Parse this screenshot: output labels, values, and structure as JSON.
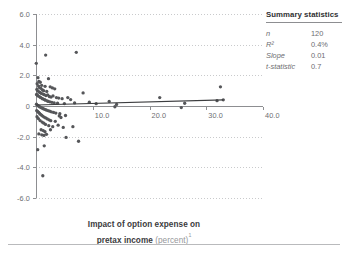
{
  "axis_title": {
    "line1": "Impact of option expense on",
    "line2_strong": "pretax income",
    "line2_light": "(percent)",
    "footnote_marker": "1"
  },
  "summary": {
    "title": "Summary statistics",
    "rows": [
      {
        "label": "n",
        "value": "120"
      },
      {
        "label": "R²",
        "value": "0.4%"
      },
      {
        "label": "Slope",
        "value": "0.01"
      },
      {
        "label": "t-statistic",
        "value": "0.7"
      }
    ]
  },
  "colors": {
    "point": "#555659",
    "trendline": "#3d3e40",
    "axis": "#8d8e91",
    "grid": "#c9cacc",
    "text": "#6d6e71",
    "title_text": "#3b3b3d",
    "light_text": "#96979a",
    "background": "#ffffff"
  },
  "chart_data": {
    "type": "scatter",
    "title": "",
    "xlabel": "Impact of option expense on pretax income (percent)",
    "ylabel": "",
    "xlim": [
      0,
      40
    ],
    "ylim": [
      -6,
      6
    ],
    "xticks": [
      0,
      10,
      20,
      30,
      40
    ],
    "xtick_labels": [
      "",
      "10.0",
      "20.0",
      "30.0",
      "40.0"
    ],
    "yticks": [
      6,
      4,
      2,
      0,
      -2,
      -4,
      -6
    ],
    "ytick_labels": [
      "6.0",
      "4.0",
      "2.0",
      "0",
      "-2.0",
      "-4.0",
      "-6.0"
    ],
    "grid": "horizontal-dotted",
    "legend": "none",
    "trendline": {
      "type": "linear",
      "slope": 0.01,
      "intercept": 0.07,
      "x_start": 0.0,
      "x_end": 33.0,
      "y_start": 0.07,
      "y_end": 0.4
    },
    "series": [
      {
        "name": "Companies",
        "marker": "circle",
        "color": "#555659",
        "points": [
          [
            0.05,
            2.78
          ],
          [
            1.7,
            3.32
          ],
          [
            7.1,
            3.5
          ],
          [
            0.35,
            1.85
          ],
          [
            0.5,
            1.6
          ],
          [
            0.75,
            1.55
          ],
          [
            1.0,
            1.35
          ],
          [
            2.2,
            1.78
          ],
          [
            2.5,
            1.25
          ],
          [
            2.9,
            1.18
          ],
          [
            3.3,
            1.12
          ],
          [
            0.2,
            1.45
          ],
          [
            0.45,
            1.3
          ],
          [
            0.6,
            1.2
          ],
          [
            0.85,
            1.15
          ],
          [
            1.15,
            1.05
          ],
          [
            1.35,
            1.0
          ],
          [
            1.6,
            1.28
          ],
          [
            1.9,
            0.95
          ],
          [
            0.15,
            1.08
          ],
          [
            0.3,
            0.98
          ],
          [
            0.55,
            0.92
          ],
          [
            0.7,
            0.88
          ],
          [
            0.95,
            0.82
          ],
          [
            1.25,
            0.78
          ],
          [
            1.45,
            0.74
          ],
          [
            1.75,
            0.68
          ],
          [
            2.05,
            0.72
          ],
          [
            2.35,
            0.62
          ],
          [
            2.65,
            0.58
          ],
          [
            3.0,
            0.66
          ],
          [
            3.6,
            0.55
          ],
          [
            4.0,
            0.52
          ],
          [
            4.6,
            0.48
          ],
          [
            0.1,
            0.75
          ],
          [
            0.25,
            0.7
          ],
          [
            0.4,
            0.65
          ],
          [
            0.65,
            0.6
          ],
          [
            0.8,
            0.56
          ],
          [
            1.05,
            0.5
          ],
          [
            1.2,
            0.46
          ],
          [
            1.5,
            0.42
          ],
          [
            1.65,
            0.38
          ],
          [
            1.95,
            0.34
          ],
          [
            2.15,
            0.3
          ],
          [
            2.45,
            0.27
          ],
          [
            2.8,
            0.24
          ],
          [
            3.2,
            0.2
          ],
          [
            3.8,
            0.18
          ],
          [
            5.0,
            0.16
          ],
          [
            5.6,
            0.55
          ],
          [
            6.1,
            0.42
          ],
          [
            6.8,
            0.2
          ],
          [
            8.3,
            0.85
          ],
          [
            9.4,
            0.25
          ],
          [
            10.6,
            0.15
          ],
          [
            12.9,
            0.3
          ],
          [
            13.9,
            -0.05
          ],
          [
            14.2,
            0.1
          ],
          [
            21.8,
            0.55
          ],
          [
            25.6,
            -0.1
          ],
          [
            26.2,
            0.18
          ],
          [
            31.9,
            0.35
          ],
          [
            32.5,
            1.25
          ],
          [
            33.0,
            0.4
          ],
          [
            0.08,
            0.12
          ],
          [
            0.22,
            0.06
          ],
          [
            0.38,
            0.02
          ],
          [
            0.52,
            -0.02
          ],
          [
            0.68,
            -0.06
          ],
          [
            0.88,
            -0.1
          ],
          [
            1.1,
            -0.14
          ],
          [
            1.3,
            -0.18
          ],
          [
            1.55,
            -0.22
          ],
          [
            1.8,
            -0.26
          ],
          [
            2.1,
            -0.3
          ],
          [
            2.4,
            -0.34
          ],
          [
            2.7,
            -0.38
          ],
          [
            3.1,
            -0.42
          ],
          [
            3.5,
            -0.46
          ],
          [
            4.2,
            -0.5
          ],
          [
            0.12,
            -0.3
          ],
          [
            0.28,
            -0.36
          ],
          [
            0.48,
            -0.42
          ],
          [
            0.62,
            -0.48
          ],
          [
            0.78,
            -0.54
          ],
          [
            0.98,
            -0.6
          ],
          [
            1.18,
            -0.66
          ],
          [
            1.42,
            -0.72
          ],
          [
            1.7,
            -0.78
          ],
          [
            2.0,
            -0.84
          ],
          [
            2.3,
            -0.9
          ],
          [
            2.6,
            -0.96
          ],
          [
            3.4,
            -1.0
          ],
          [
            4.4,
            -0.75
          ],
          [
            5.2,
            -0.62
          ],
          [
            0.18,
            -0.7
          ],
          [
            0.42,
            -0.82
          ],
          [
            0.72,
            -0.95
          ],
          [
            1.08,
            -1.05
          ],
          [
            1.38,
            -1.12
          ],
          [
            1.68,
            -1.2
          ],
          [
            2.25,
            -1.28
          ],
          [
            2.95,
            -1.35
          ],
          [
            3.9,
            -1.25
          ],
          [
            4.8,
            -1.4
          ],
          [
            6.5,
            -1.35
          ],
          [
            0.9,
            -1.55
          ],
          [
            1.28,
            -1.6
          ],
          [
            1.58,
            -1.68
          ],
          [
            2.55,
            -1.55
          ],
          [
            0.5,
            -1.82
          ],
          [
            1.02,
            -1.88
          ],
          [
            1.4,
            -1.92
          ],
          [
            1.85,
            -1.85
          ],
          [
            5.3,
            -2.05
          ],
          [
            7.5,
            -2.3
          ],
          [
            4.1,
            -0.65
          ],
          [
            0.3,
            -2.85
          ],
          [
            1.45,
            -2.6
          ],
          [
            1.2,
            -4.55
          ]
        ]
      }
    ]
  }
}
